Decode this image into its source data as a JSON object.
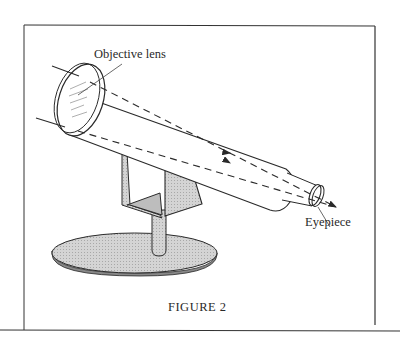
{
  "figure": {
    "caption": "FIGURE 2",
    "labels": {
      "objective_lens": "Objective lens",
      "eyepiece": "Eyepiece"
    },
    "components": [
      "objective-lens",
      "telescope-tube",
      "eyepiece",
      "light-rays",
      "mount-bracket",
      "pillar",
      "base"
    ],
    "colors": {
      "line": "#2a2a2a",
      "shade": "#cfcfcf",
      "background": "#ffffff"
    }
  }
}
